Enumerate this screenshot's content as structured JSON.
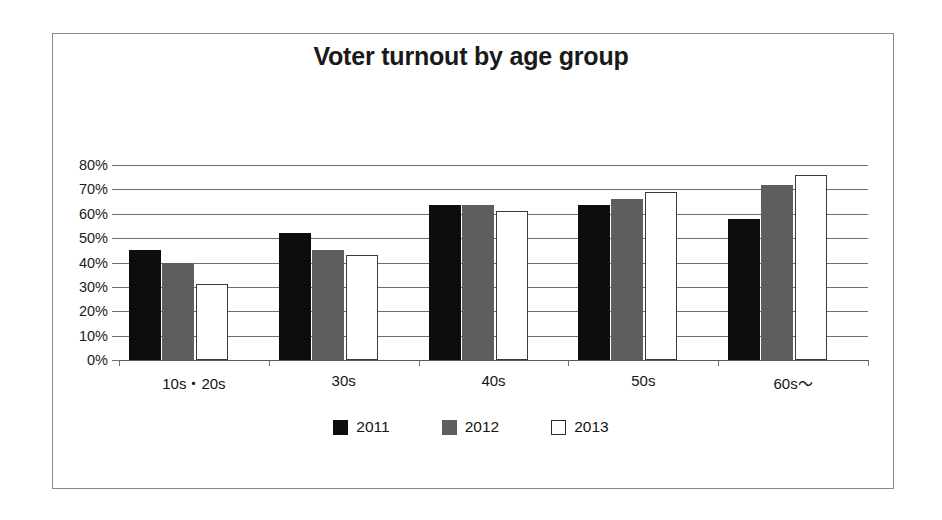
{
  "chart_data": {
    "type": "bar",
    "title": "Voter turnout by age group",
    "xlabel": "",
    "ylabel": "",
    "categories": [
      "10s・20s",
      "30s",
      "40s",
      "50s",
      "60s〜"
    ],
    "series": [
      {
        "name": "2011",
        "color": "#0d0d0d",
        "values": [
          45,
          52,
          63.5,
          63.5,
          58
        ]
      },
      {
        "name": "2012",
        "color": "#5e5e5e",
        "values": [
          40,
          45,
          63.5,
          66,
          72
        ]
      },
      {
        "name": "2013",
        "color": "#ffffff",
        "values": [
          31,
          43,
          61,
          69,
          76
        ]
      }
    ],
    "ylim": [
      0,
      80
    ],
    "ytick_values": [
      80,
      70,
      60,
      50,
      40,
      30,
      20,
      10,
      0
    ],
    "ytick_labels": [
      "80%",
      "70%",
      "60%",
      "50%",
      "40%",
      "30%",
      "20%",
      "10%",
      "0%"
    ],
    "grid": true,
    "legend_position": "bottom"
  }
}
